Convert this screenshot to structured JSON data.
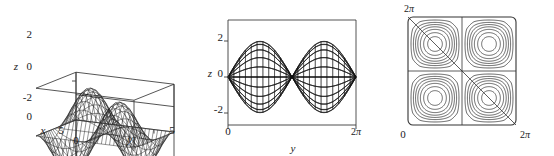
{
  "figure": {
    "title": "",
    "background_color": "#ffffff",
    "line_color": "#111111",
    "panel_count": 3
  },
  "chart_data": [
    {
      "id": "surface-3d",
      "type": "surface",
      "title": "",
      "xlabel": "x",
      "ylabel": "y",
      "zlabel": "z",
      "xlim": [
        0,
        6.283185
      ],
      "ylim": [
        0,
        6.283185
      ],
      "zlim": [
        -2.4,
        2.4
      ],
      "xticks": [
        0,
        5
      ],
      "xtick_labels": [
        "0",
        "5"
      ],
      "yticks": [
        0,
        5
      ],
      "ytick_labels": [
        "0",
        "5"
      ],
      "zticks": [
        -2,
        0,
        2
      ],
      "ztick_labels": [
        "-2",
        "0",
        "2"
      ],
      "z_origin_label": "0",
      "grid": false,
      "legend": "none",
      "mesh_nu": 24,
      "mesh_nv": 24,
      "function": "z = 2*sin(x)*sin(y)",
      "amplitude": 2,
      "view": "3d wireframe box",
      "description": "Saddle-like doubly periodic wireframe surface inside an open 3-D axis box"
    },
    {
      "id": "edge-on-view",
      "type": "surface",
      "title": "",
      "xlabel": "y",
      "ylabel": "",
      "zlabel": "z",
      "xlim": [
        0,
        6.283185
      ],
      "zlim": [
        -2.6,
        2.6
      ],
      "xticks": [
        0,
        6.283185
      ],
      "xtick_labels": [
        "0",
        "2π"
      ],
      "zticks": [
        -2,
        0,
        2
      ],
      "ztick_labels": [
        "-2",
        "0",
        "2"
      ],
      "grid": false,
      "legend": "none",
      "mesh_nu": 22,
      "mesh_nv": 22,
      "function": "z = 2*sin(x)*sin(y)",
      "amplitude": 2,
      "view": "projected along x, sine envelope",
      "description": "Same surface seen edge-on; mesh fills a full sine envelope between +2 and -2"
    },
    {
      "id": "contour-map",
      "type": "contour",
      "title": "",
      "xlabel": "",
      "ylabel": "",
      "xlim": [
        0,
        6.283185
      ],
      "ylim": [
        0,
        6.283185
      ],
      "xticks": [
        0,
        6.283185
      ],
      "xtick_labels": [
        "0",
        "2π"
      ],
      "yticks": [
        0,
        6.283185
      ],
      "ytick_labels": [
        "0",
        "2π"
      ],
      "corner_label_topleft": "2π",
      "corner_label_bottomleft": "0",
      "corner_label_bottomright": "2π",
      "levels": [
        -1.8,
        -1.4,
        -1.0,
        -0.6,
        -0.2,
        0,
        0.2,
        0.6,
        1.0,
        1.4,
        1.8
      ],
      "zero_contours": [
        "horizontal midline",
        "vertical midline",
        "anti-diagonal"
      ],
      "extrema": [
        {
          "x": 1.571,
          "y": 1.571,
          "value": 2.0,
          "kind": "max"
        },
        {
          "x": 4.712,
          "y": 1.571,
          "value": -2.0,
          "kind": "min"
        },
        {
          "x": 1.571,
          "y": 4.712,
          "value": -2.0,
          "kind": "min"
        },
        {
          "x": 4.712,
          "y": 4.712,
          "value": 2.0,
          "kind": "max"
        }
      ],
      "grid": false,
      "legend": "none",
      "function": "z = 2*sin(x)*sin(y)",
      "description": "Square contour map with four nested closed-loop extrema and straight zero-level cross plus diagonal"
    }
  ],
  "panels": {
    "surface3d": {
      "name": "3D surface plot",
      "axis_x_label": "x",
      "axis_y_label": "y",
      "axis_z_label": "z",
      "z_tick_2": "2",
      "z_tick_0": "0",
      "z_tick_neg2": "-2",
      "z_base_0": "0",
      "x_tick_5": "5",
      "y_tick_0": "0",
      "y_tick_5": "5"
    },
    "edgeview": {
      "name": "Edge-on projection plot",
      "axis_x_label": "y",
      "axis_z_label": "z",
      "z_tick_2": "2",
      "z_tick_0": "0",
      "z_tick_neg2": "-2",
      "x_tick_0": "0",
      "x_tick_2pi_num": "2",
      "x_tick_2pi_sym": "π"
    },
    "contour": {
      "name": "Contour plot",
      "top_left_num": "2",
      "top_left_sym": "π",
      "bottom_left": "0",
      "bottom_right_num": "2",
      "bottom_right_sym": "π"
    }
  }
}
